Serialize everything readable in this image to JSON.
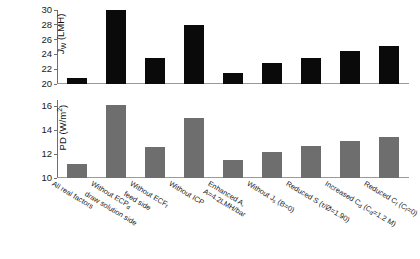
{
  "chart_data": [
    {
      "type": "bar",
      "panel": "top",
      "title": "",
      "xlabel": "",
      "ylabel": "J_W (LMH)",
      "ylabel_parts": {
        "symbol": "J",
        "subscript": "W",
        "units": "(LMH)"
      },
      "ylim": [
        20,
        30
      ],
      "yticks": [
        20,
        22,
        24,
        26,
        28,
        30
      ],
      "grid": false,
      "bar_color": "#0a0a0a",
      "categories": [
        "All real factors",
        "Without ECPd, draw solution side",
        "Without ECPf, feed side",
        "Without ICP",
        "Enhanced A, A=4.2LMH/bar",
        "Without Js (B=0)",
        "Reduced S (τ/Ø=1.90)",
        "Increased Cd (Cd=1.2 M)",
        "Reduced Cf (Cf=0)"
      ],
      "values": [
        20.8,
        30.0,
        23.5,
        28.0,
        21.5,
        22.8,
        23.5,
        24.5,
        25.1
      ]
    },
    {
      "type": "bar",
      "panel": "bottom",
      "title": "",
      "xlabel": "",
      "ylabel": "PD (W/m2)",
      "ylabel_parts": {
        "symbol": "PD",
        "units": "(W/m",
        "exponent": "2",
        "units_close": ")"
      },
      "ylim": [
        10,
        16.5
      ],
      "yticks": [
        10,
        12,
        14,
        16
      ],
      "grid": false,
      "bar_color": "#6e6e6e",
      "categories": [
        "All real factors",
        "Without ECPd, draw solution side",
        "Without ECPf, feed side",
        "Without ICP",
        "Enhanced A, A=4.2LMH/bar",
        "Without Js (B=0)",
        "Reduced S (τ/Ø=1.90)",
        "Increased Cd (Cd=1.2 M)",
        "Reduced Cf (Cf=0)"
      ],
      "values": [
        11.2,
        16.1,
        12.6,
        15.0,
        11.5,
        12.2,
        12.7,
        13.1,
        13.4
      ]
    }
  ],
  "axes": {
    "top": {
      "ylabel_symbol": "J",
      "ylabel_sub": "W",
      "ylabel_units": " (LMH)",
      "ticks": [
        "30",
        "28",
        "26",
        "24",
        "22",
        "20"
      ]
    },
    "bottom": {
      "ylabel_symbol": "PD (W/m",
      "ylabel_sup": "2",
      "ylabel_close": ")",
      "ticks": [
        "16",
        "14",
        "12",
        "10"
      ]
    }
  },
  "categories": [
    {
      "line1": "All real factors",
      "line2": ""
    },
    {
      "line1": "Without ECP",
      "sub1": "d",
      "line2": "draw solution side"
    },
    {
      "line1": "Without ECF",
      "sub1": "f",
      "line2": "feed side"
    },
    {
      "line1": "Without ICP",
      "line2": ""
    },
    {
      "line1": "Enhanced A,",
      "line2": "A=4.2LMH/bar"
    },
    {
      "line1": "Without J",
      "sub1": "s",
      "line1b": " (B=0)",
      "line2": ""
    },
    {
      "line1": "Reduced S (τ/Ø=1.90)",
      "line2": ""
    },
    {
      "line1": "Increased C",
      "sub1": "d",
      "line1b": " (C",
      "sub2": "d",
      "line1c": "=1.2 M)",
      "line2": ""
    },
    {
      "line1": "Reduced C",
      "sub1": "f",
      "line1b": " (C",
      "sub2": "f",
      "line1c": "=0)",
      "line2": ""
    }
  ]
}
